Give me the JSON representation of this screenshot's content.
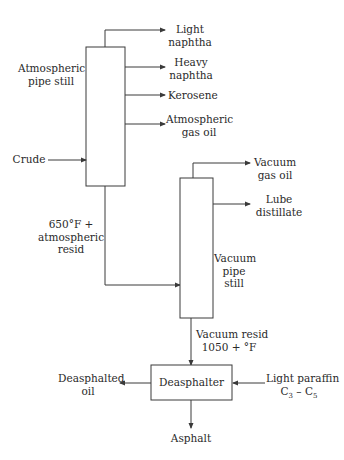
{
  "diagram": {
    "type": "process-flow",
    "units": {
      "atmospheric_pipe_still": {
        "label_lines": [
          "Atmospheric",
          "pipe still"
        ]
      },
      "vacuum_pipe_still": {
        "label_lines": [
          "Vacuum",
          "pipe",
          "still"
        ]
      },
      "deasphalter": {
        "label": "Deasphalter"
      }
    },
    "streams": {
      "crude": {
        "label_lines": [
          "Crude"
        ]
      },
      "light_naphtha": {
        "label_lines": [
          "Light",
          "naphtha"
        ]
      },
      "heavy_naphtha": {
        "label_lines": [
          "Heavy",
          "naphtha"
        ]
      },
      "kerosene": {
        "label_lines": [
          "Kerosene"
        ]
      },
      "atmospheric_gas_oil": {
        "label_lines": [
          "Atmospheric",
          "gas oil"
        ]
      },
      "atmospheric_resid": {
        "label_lines": [
          "650°F +",
          "atmospheric",
          "resid"
        ]
      },
      "vacuum_gas_oil": {
        "label_lines": [
          "Vacuum",
          "gas oil"
        ]
      },
      "lube_distillate": {
        "label_lines": [
          "Lube",
          "distillate"
        ]
      },
      "vacuum_resid": {
        "label_lines": [
          "Vacuum resid",
          "1050 + °F"
        ]
      },
      "deasphalted_oil": {
        "label_lines": [
          "Deasphalted",
          "oil"
        ]
      },
      "light_paraffin": {
        "label_lines": [
          "Light paraffin"
        ],
        "formula": {
          "c1": "C",
          "s1": "3",
          "dash": " – ",
          "c2": "C",
          "s2": "5"
        }
      },
      "asphalt": {
        "label_lines": [
          "Asphalt"
        ]
      }
    },
    "colors": {
      "line": "#3a3a3a",
      "text": "#2a2a2a",
      "background": "#ffffff"
    }
  }
}
